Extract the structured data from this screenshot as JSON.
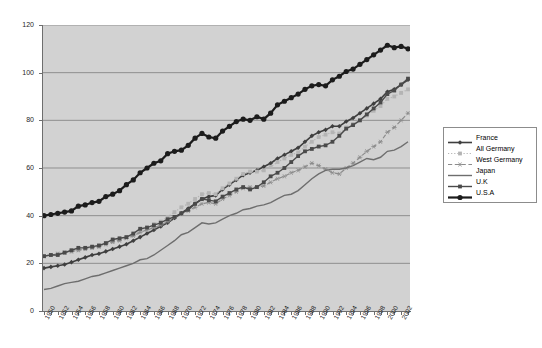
{
  "chart_data": {
    "type": "line",
    "title": "",
    "xlabel": "",
    "ylabel": "",
    "ylim": [
      0,
      120
    ],
    "ytick_step": 20,
    "yticks": [
      0,
      20,
      40,
      60,
      80,
      100,
      120
    ],
    "grid": true,
    "grid_axis": "y",
    "legend_position": "right",
    "plot_background": "#d2d2d2",
    "x": [
      1950,
      1951,
      1952,
      1953,
      1954,
      1955,
      1956,
      1957,
      1958,
      1959,
      1960,
      1961,
      1962,
      1963,
      1964,
      1965,
      1966,
      1967,
      1968,
      1969,
      1970,
      1971,
      1972,
      1973,
      1974,
      1975,
      1976,
      1977,
      1978,
      1979,
      1980,
      1981,
      1982,
      1983,
      1984,
      1985,
      1986,
      1987,
      1988,
      1989,
      1990,
      1991,
      1992,
      1993,
      1994,
      1995,
      1996,
      1997,
      1998,
      1999,
      2000,
      2001,
      2002,
      2003
    ],
    "xtick_labels": [
      "1950",
      "1952",
      "1954",
      "1956",
      "1958",
      "1960",
      "1962",
      "1964",
      "1966",
      "1968",
      "1970",
      "1972",
      "1974",
      "1976",
      "1978",
      "1980",
      "1982",
      "1984",
      "1986",
      "1988",
      "1990",
      "1992",
      "1994",
      "1996",
      "1998",
      "2000",
      "2002"
    ],
    "series": [
      {
        "name": "France",
        "color": "#3f3f3f",
        "marker": "diamond",
        "dash": "none",
        "width": 1.6,
        "values": [
          18,
          18.5,
          19,
          19.5,
          20.5,
          21.5,
          22.5,
          23.5,
          24,
          25,
          26,
          27,
          28,
          29.5,
          31,
          32.5,
          34,
          35.5,
          37,
          39,
          41,
          43,
          45,
          47,
          48,
          48.5,
          51,
          53,
          55,
          57,
          58,
          59,
          60.5,
          62,
          64,
          65.5,
          67,
          68.5,
          71,
          73.5,
          75,
          76,
          77.5,
          77.5,
          79.5,
          81,
          83,
          85,
          87,
          89,
          92,
          93,
          95,
          97
        ]
      },
      {
        "name": "All Germany",
        "color": "#b4b4b4",
        "marker": "square",
        "dash": "dotted",
        "width": 1.2,
        "values": [
          23,
          23.5,
          24,
          24.5,
          25,
          25.5,
          26,
          26.5,
          27,
          28,
          29,
          30,
          31,
          32,
          33.5,
          35,
          36.5,
          37.5,
          39.5,
          41.5,
          43.5,
          45,
          47,
          49,
          49.5,
          49,
          51.5,
          53.5,
          55.5,
          57.5,
          58.5,
          58.5,
          59,
          60.5,
          62.5,
          64,
          65.5,
          66.5,
          69,
          71,
          73,
          74,
          75,
          74.5,
          77,
          78.5,
          80,
          82,
          84,
          86,
          89,
          90,
          91.5,
          93
        ]
      },
      {
        "name": "West Germany",
        "color": "#8c8c8c",
        "marker": "asterisk",
        "dash": "dashed",
        "width": 1.2,
        "values": [
          23,
          23.5,
          24,
          24.5,
          25,
          25.5,
          26,
          26.5,
          27,
          28,
          29,
          29.5,
          30.5,
          31.5,
          33,
          34,
          35,
          36,
          37.5,
          39,
          41,
          42,
          43.5,
          45,
          45.5,
          45,
          47,
          48.5,
          50,
          51.5,
          52,
          52,
          52.5,
          54,
          55.5,
          56.5,
          58,
          59,
          60.5,
          62,
          61,
          59.5,
          58,
          57.5,
          60,
          62,
          64.5,
          67,
          69,
          71,
          75,
          77,
          80,
          83
        ]
      },
      {
        "name": "Japan",
        "color": "#6e6e6e",
        "marker": "none",
        "dash": "none",
        "width": 1.4,
        "values": [
          9,
          9.5,
          10.5,
          11.5,
          12,
          12.5,
          13.5,
          14.5,
          15,
          16,
          17,
          18,
          19,
          20,
          21.5,
          22,
          23.5,
          25.5,
          27.5,
          29.5,
          32,
          33,
          35,
          37,
          36.5,
          37,
          38.5,
          40,
          41,
          42.5,
          43,
          44,
          44.5,
          45.5,
          47,
          48.5,
          49,
          50.5,
          53,
          55.5,
          57.5,
          59,
          59.5,
          59.5,
          60,
          61,
          62.5,
          64,
          63.5,
          64.5,
          67,
          67.5,
          69,
          71
        ]
      },
      {
        "name": "U.K",
        "color": "#4a4a4a",
        "marker": "square",
        "dash": "none",
        "width": 1.4,
        "values": [
          23,
          23.5,
          23.5,
          24.5,
          25.5,
          26.5,
          26.5,
          27,
          27.5,
          28.5,
          30,
          30.5,
          31,
          32.5,
          34.5,
          35,
          36,
          37,
          38.5,
          39.5,
          41,
          42.5,
          45,
          47,
          46.5,
          46,
          48,
          49.5,
          51,
          52,
          51,
          52,
          54,
          56.5,
          58,
          60,
          62.5,
          65,
          67,
          68,
          69,
          69.5,
          71,
          73.5,
          76.5,
          78,
          80,
          82.5,
          85,
          87.5,
          91,
          92.5,
          95,
          97.5
        ]
      },
      {
        "name": "U.S.A",
        "color": "#1c1c1c",
        "marker": "circle",
        "dash": "none",
        "width": 2.2,
        "values": [
          40,
          40.5,
          41,
          41.5,
          42,
          44,
          44.5,
          45.5,
          46,
          48,
          49,
          50.5,
          53,
          55,
          58,
          60,
          62,
          63,
          66,
          67,
          67.5,
          69.5,
          72.5,
          74.5,
          73,
          72.5,
          75.5,
          77.5,
          79.5,
          80.5,
          80,
          81.5,
          80.5,
          83,
          86.5,
          88,
          89.5,
          91,
          93,
          94.5,
          95,
          94.5,
          97,
          98.5,
          100.5,
          101.5,
          103.5,
          105.5,
          107.5,
          109.5,
          111.5,
          110.5,
          111,
          110
        ]
      }
    ]
  }
}
